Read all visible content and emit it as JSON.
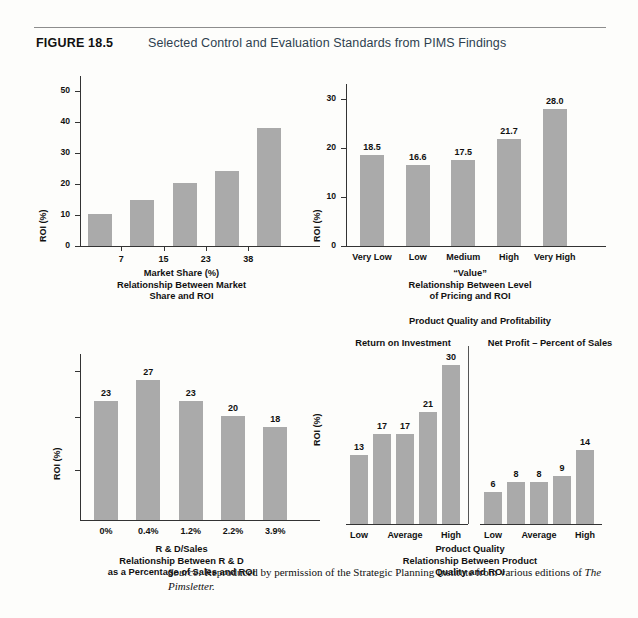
{
  "figure": {
    "label": "FIGURE 18.5",
    "title": "Selected Control and Evaluation Standards from PIMS Findings"
  },
  "source_note": {
    "prefix": "Source:",
    "text": " Reproduced by permission of the Strategic Planning Institute from various editions of ",
    "italic_tail": "The Pimsletter."
  },
  "colors": {
    "bar": "#aaaaaa",
    "axis": "#333333",
    "title": "#2e3f4f",
    "rule": "#8d8d8d",
    "page": "#fdfdfb"
  },
  "chart_data": [
    {
      "id": "market-share",
      "type": "bar",
      "title": "",
      "xlabel": "Market Share (%)",
      "ylabel": "ROI (%)",
      "caption": [
        "Market Share (%)",
        "Relationship Between Market",
        "Share and ROI"
      ],
      "categories": [
        "",
        "7",
        "15",
        "23",
        "38"
      ],
      "tick_labels": [
        "7",
        "15",
        "23",
        "38"
      ],
      "values": [
        10.2,
        15.0,
        20.3,
        24.3,
        38.3
      ],
      "value_labels": [
        "",
        "",
        "",
        "",
        ""
      ],
      "yticks": [
        0,
        10,
        20,
        30,
        40,
        50
      ],
      "ylim": [
        0,
        55
      ],
      "grid": false
    },
    {
      "id": "pricing-value",
      "type": "bar",
      "title": "",
      "xlabel": "“Value”",
      "ylabel": "ROI (%)",
      "caption": [
        "“Value”",
        "Relationship Between Level",
        "of Pricing and ROI"
      ],
      "categories": [
        "Very Low",
        "Low",
        "Medium",
        "High",
        "Very High"
      ],
      "values": [
        18.5,
        16.6,
        17.5,
        21.7,
        28.0
      ],
      "value_labels": [
        "18.5",
        "16.6",
        "17.5",
        "21.7",
        "28.0"
      ],
      "yticks": [
        0,
        10,
        20,
        30
      ],
      "ylim": [
        0,
        33
      ],
      "grid": false
    },
    {
      "id": "rd-sales",
      "type": "bar",
      "title": "",
      "xlabel": "R & D/Sales",
      "ylabel": "ROI (%)",
      "caption": [
        "R & D/Sales",
        "Relationship Between R & D",
        "as a Percentage of Sales and ROI"
      ],
      "categories": [
        "0%",
        "0.4%",
        "1.2%",
        "2.2%",
        "3.9%"
      ],
      "values": [
        23,
        27,
        23,
        20,
        18
      ],
      "value_labels": [
        "23",
        "27",
        "23",
        "20",
        "18"
      ],
      "yticks": [],
      "ylim": [
        0,
        32
      ],
      "grid": false
    },
    {
      "id": "product-quality",
      "type": "bar",
      "title": "Product Quality and Profitability",
      "xlabel": "Product Quality",
      "ylabel": "ROI (%)",
      "caption": [
        "Product Quality",
        "Relationship Between Product",
        "Quality and ROI"
      ],
      "panels": [
        {
          "name": "Return on Investment",
          "categories": [
            "Low",
            "",
            "Average",
            "",
            "High"
          ],
          "tick_labels": [
            "Low",
            "Average",
            "High"
          ],
          "values": [
            13,
            17,
            17,
            21,
            30
          ],
          "value_labels": [
            "13",
            "17",
            "17",
            "21",
            "30"
          ]
        },
        {
          "name": "Net Profit – Percent of Sales",
          "categories": [
            "Low",
            "",
            "Average",
            "",
            "High"
          ],
          "tick_labels": [
            "Low",
            "Average",
            "High"
          ],
          "values": [
            6,
            8,
            8,
            9,
            14
          ],
          "value_labels": [
            "6",
            "8",
            "8",
            "9",
            "14"
          ]
        }
      ],
      "ylim": [
        0,
        32
      ],
      "grid": false
    }
  ]
}
